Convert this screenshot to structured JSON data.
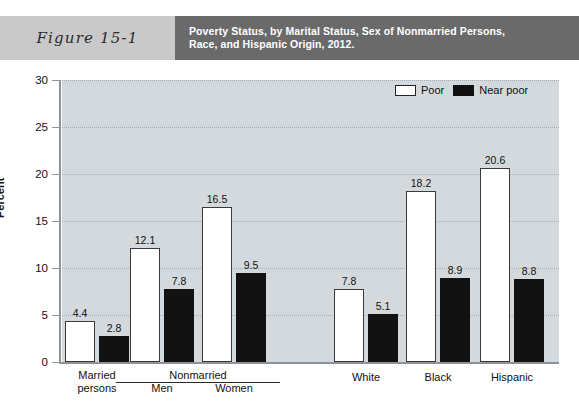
{
  "header": {
    "figure_label": "Figure 15-1",
    "title_lines": [
      "Poverty Status, by Marital Status, Sex of Nonmarried Persons,",
      "Race, and Hispanic Origin, 2012."
    ],
    "band_color": "#c9c9c9",
    "title_band_color": "#6a6a6a"
  },
  "legend": {
    "position": "top-right",
    "items": [
      {
        "label": "Poor",
        "swatch": "white",
        "color": "#ffffff"
      },
      {
        "label": "Near poor",
        "swatch": "black",
        "color": "#101010"
      }
    ]
  },
  "chart_data": {
    "type": "bar",
    "title": "Poverty Status, by Marital Status, Sex of Nonmarried Persons, Race, and Hispanic Origin, 2012.",
    "xlabel": "",
    "ylabel": "Percent",
    "ylim": [
      0,
      30
    ],
    "yticks": [
      0,
      5,
      10,
      15,
      20,
      25,
      30
    ],
    "ytick_labels": [
      "0",
      "5",
      "10",
      "15",
      "20",
      "25",
      "30"
    ],
    "grid": true,
    "grid_style": "dotted-horizontal",
    "categories": [
      "Married persons",
      "Men",
      "Women",
      "White",
      "Black",
      "Hispanic"
    ],
    "category_lines": [
      [
        "Married",
        "persons"
      ],
      [
        "Men"
      ],
      [
        "Women"
      ],
      [
        "White"
      ],
      [
        "Black"
      ],
      [
        "Hispanic"
      ]
    ],
    "group_bracket": {
      "label": "Nonmarried",
      "spans": [
        "Men",
        "Women"
      ]
    },
    "series": [
      {
        "name": "Poor",
        "values": [
          4.4,
          12.1,
          16.5,
          7.8,
          18.2,
          20.6
        ]
      },
      {
        "name": "Near poor",
        "values": [
          2.8,
          7.8,
          9.5,
          5.1,
          8.9,
          8.8
        ]
      }
    ],
    "plot_background": "#d4d9dd"
  }
}
